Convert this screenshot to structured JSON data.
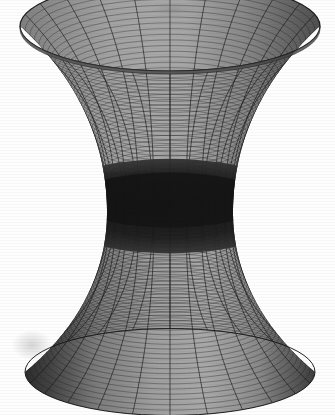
{
  "figure": {
    "title": "",
    "background_color": "#fefefe",
    "ink_color": "#2b2b2b",
    "width": 335,
    "height": 415
  },
  "artifacts": {
    "smudges": [
      {
        "name": "top-smudge",
        "x": 150,
        "y": 2,
        "w": 46,
        "h": 14
      },
      {
        "name": "lower-left-smudge",
        "x": 12,
        "y": 330,
        "w": 40,
        "h": 30
      }
    ]
  },
  "chart_data": {
    "type": "surface",
    "title": "",
    "subtitle": "",
    "xlabel": "",
    "ylabel": "",
    "zlabel": "",
    "grid": true,
    "legend": false,
    "legend_position": "none",
    "colormap": "grayscale",
    "surface_name": "hyperboloid-of-one-sheet",
    "equation": "x^2 + y^2 - z^2 = a^2",
    "parameterization": {
      "x": "r(v) * cos(u)",
      "y": "r(v) * sin(u)",
      "z": "c * v",
      "radius_profile": "r(v) = a * cosh(v / b)"
    },
    "parameters": {
      "a_waist_radius": 0.42,
      "b_flare": 1.0,
      "c_height_scale": 1.0
    },
    "domain": {
      "u_label": "theta",
      "u_min": 0,
      "u_max": 6.2832,
      "u_steps": 24,
      "v_label": "v",
      "v_min": -1.45,
      "v_max": 1.45,
      "v_steps": 80
    },
    "projection": {
      "type": "orthographic",
      "elevation_deg": 18,
      "azimuth_deg": 0,
      "ellipse_squash": 0.3
    },
    "geometry_pixels": {
      "center_x": 170,
      "top_rim_y": 26,
      "top_rim_rx": 150,
      "bottom_rim_y": 372,
      "bottom_rim_rx": 145,
      "waist_y": 212,
      "waist_rx": 63,
      "rim_ellipse_ry": 45,
      "bottom_ellipse_ry": 27
    },
    "shading": {
      "outer_light_gray": "#b4b4b4",
      "outer_mid_gray": "#8a8a8a",
      "outer_dark_gray": "#4e4e4e",
      "inner_gray": "#9b9b9b",
      "waist_shadow": "#141414",
      "mesh_line_color": "#303030",
      "meridian_line_color": "#1e1e1e"
    },
    "tick_labels": {
      "x": [],
      "y": [],
      "z": []
    },
    "annotations": []
  }
}
